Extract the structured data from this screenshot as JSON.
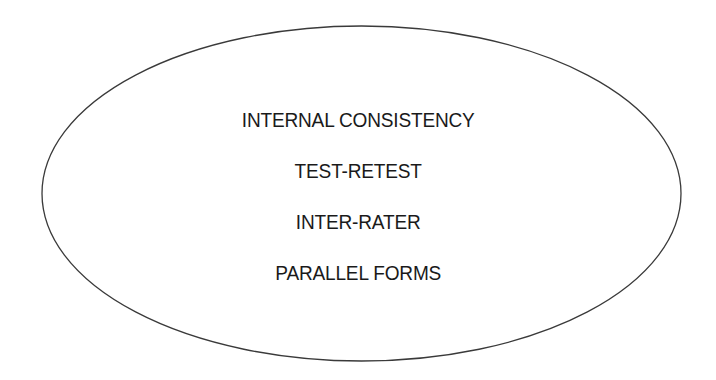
{
  "diagram": {
    "shape": "ellipse",
    "stroke_color": "#3a3a3a",
    "fill_color": "#ffffff",
    "items": [
      {
        "label": "INTERNAL CONSISTENCY"
      },
      {
        "label": "TEST-RETEST"
      },
      {
        "label": "INTER-RATER"
      },
      {
        "label": "PARALLEL FORMS"
      }
    ]
  }
}
